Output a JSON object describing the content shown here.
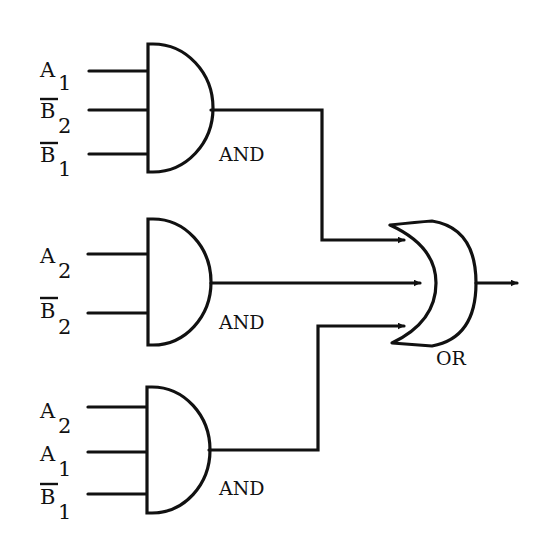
{
  "diagram": {
    "type": "logic-circuit",
    "colors": {
      "stroke": "#111111",
      "background": "#ffffff",
      "gate_fill": "#ffffff"
    },
    "gates": [
      {
        "id": "and1",
        "type": "AND",
        "label": "AND",
        "inputs": [
          {
            "name": "A",
            "sub": "1",
            "negated": false
          },
          {
            "name": "B",
            "sub": "2",
            "negated": true
          },
          {
            "name": "B",
            "sub": "1",
            "negated": true
          }
        ]
      },
      {
        "id": "and2",
        "type": "AND",
        "label": "AND",
        "inputs": [
          {
            "name": "A",
            "sub": "2",
            "negated": false
          },
          {
            "name": "B",
            "sub": "2",
            "negated": true
          }
        ]
      },
      {
        "id": "and3",
        "type": "AND",
        "label": "AND",
        "inputs": [
          {
            "name": "A",
            "sub": "2",
            "negated": false
          },
          {
            "name": "A",
            "sub": "1",
            "negated": false
          },
          {
            "name": "B",
            "sub": "1",
            "negated": true
          }
        ]
      },
      {
        "id": "or1",
        "type": "OR",
        "label": "OR",
        "inputs_from": [
          "and1",
          "and2",
          "and3"
        ]
      }
    ]
  }
}
